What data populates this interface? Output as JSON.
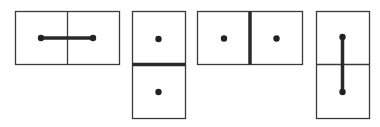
{
  "diagram": {
    "colors": {
      "stroke": "#3a3a3a",
      "fill": "#ffffff",
      "dot": "#222222",
      "thick": "#2a2a2a"
    },
    "panels": [
      {
        "id": "horizontal-connected",
        "orientation": "horizontal",
        "relation": "connected",
        "rect": [
          15,
          11,
          104,
          53
        ],
        "divider": "thin"
      },
      {
        "id": "vertical-walled",
        "orientation": "vertical",
        "relation": "walled",
        "rect": [
          132,
          11,
          53,
          107
        ],
        "divider": "thick"
      },
      {
        "id": "horizontal-walled",
        "orientation": "horizontal",
        "relation": "walled",
        "rect": [
          197,
          11,
          105,
          53
        ],
        "divider": "thick"
      },
      {
        "id": "vertical-connected",
        "orientation": "vertical",
        "relation": "connected",
        "rect": [
          316,
          11,
          53,
          107
        ],
        "divider": "thin"
      }
    ]
  }
}
